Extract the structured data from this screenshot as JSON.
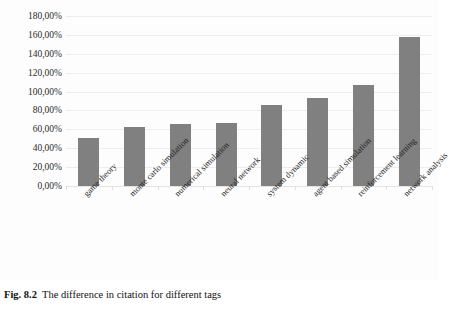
{
  "caption": {
    "figure_number": "Fig. 8.2",
    "text": "The difference in citation for different tags"
  },
  "chart_data": {
    "type": "bar",
    "title": "",
    "xlabel": "",
    "ylabel": "",
    "ylim": [
      0,
      180
    ],
    "grid": true,
    "legend": false,
    "orientation": "vertical",
    "bar_color": "#808080",
    "background_color": "#fdfdfd",
    "gridline_color": "#ededed",
    "value_suffix": "%",
    "decimal_separator": ",",
    "categories": [
      "game theory",
      "monte carlo simulation",
      "numerical simulation",
      "neural network",
      "system dynamic",
      "agent based simulation",
      "reinforcement learning",
      "network analysis"
    ],
    "values": [
      51,
      62,
      66,
      67,
      86,
      93,
      107,
      158
    ],
    "value_labels": [
      "51,00%",
      "62,00%",
      "66,00%",
      "67,00%",
      "86,00%",
      "93,00%",
      "107,00%",
      "158,00%"
    ],
    "yticks": [
      0,
      20,
      40,
      60,
      80,
      100,
      120,
      140,
      160,
      180
    ],
    "ytick_labels": [
      "0,00%",
      "20,00%",
      "40,00%",
      "60,00%",
      "80,00%",
      "100,00%",
      "120,00%",
      "140,00%",
      "160,00%",
      "180,00%"
    ]
  }
}
